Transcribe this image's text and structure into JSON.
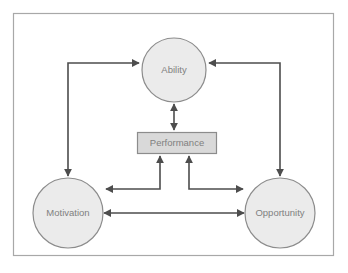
{
  "diagram": {
    "type": "concept-model",
    "frame": {
      "border_color": "#a8a8a8",
      "background_color": "#ffffff"
    },
    "palette": {
      "node_fill": "#ebebeb",
      "node_stroke": "#8c8c8c",
      "box_fill": "#d9d9d9",
      "box_stroke": "#8c8c8c",
      "connector": "#4d4d4d",
      "label_text": "#808080"
    },
    "nodes": [
      {
        "id": "ability",
        "label": "Ability",
        "shape": "circle",
        "cx": 174,
        "cy": 70,
        "r": 32
      },
      {
        "id": "performance",
        "label": "Performance",
        "shape": "rectangle",
        "x": 137,
        "y": 132,
        "width": 80,
        "height": 21
      },
      {
        "id": "motivation",
        "label": "Motivation",
        "shape": "circle",
        "cx": 68,
        "cy": 213,
        "r": 35
      },
      {
        "id": "opportunity",
        "label": "Opportunity",
        "shape": "circle",
        "cx": 280,
        "cy": 213,
        "r": 35
      }
    ],
    "connectors": [
      {
        "id": "ability-performance",
        "from": "ability",
        "to": "performance",
        "direction": "bidirectional",
        "style": "straight-vertical"
      },
      {
        "id": "motivation-ability",
        "from": "motivation",
        "to": "ability",
        "direction": "bidirectional",
        "style": "elbow-left"
      },
      {
        "id": "opportunity-ability",
        "from": "opportunity",
        "to": "ability",
        "direction": "bidirectional",
        "style": "elbow-right"
      },
      {
        "id": "motivation-opportunity",
        "from": "motivation",
        "to": "opportunity",
        "direction": "bidirectional",
        "style": "straight-horizontal"
      },
      {
        "id": "motivation-performance",
        "from": "motivation",
        "to": "performance",
        "direction": "to-performance",
        "style": "elbow-up-left"
      },
      {
        "id": "opportunity-performance",
        "from": "opportunity",
        "to": "performance",
        "direction": "to-performance",
        "style": "elbow-up-right"
      }
    ]
  }
}
